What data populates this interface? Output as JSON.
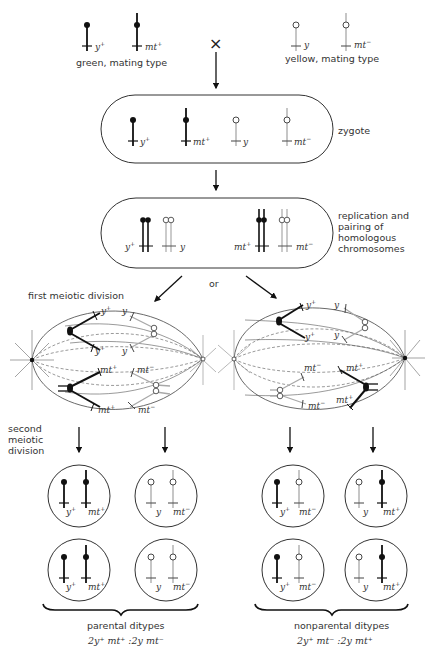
{
  "parents": {
    "left": {
      "label": "green, mating type",
      "genes": [
        {
          "name": "y",
          "sup": "+"
        },
        {
          "name": "mt",
          "sup": "+"
        }
      ],
      "allele_color": "dark"
    },
    "cross_symbol": "×",
    "right": {
      "label": "yellow, mating type",
      "genes": [
        {
          "name": "y",
          "sup": ""
        },
        {
          "name": "mt",
          "sup": "−"
        }
      ],
      "allele_color": "light"
    }
  },
  "stages": {
    "zygote": {
      "label": "zygote",
      "genes": [
        {
          "name": "y",
          "sup": "+"
        },
        {
          "name": "mt",
          "sup": "+"
        },
        {
          "name": "y",
          "sup": ""
        },
        {
          "name": "mt",
          "sup": "−"
        }
      ]
    },
    "replication": {
      "label_lines": [
        "replication and",
        "pairing of",
        "homologous",
        "chromosomes"
      ],
      "genes": [
        {
          "name": "y",
          "sup": "+"
        },
        {
          "name": "y",
          "sup": ""
        },
        {
          "name": "mt",
          "sup": "+"
        },
        {
          "name": "mt",
          "sup": "−"
        }
      ]
    },
    "or_label": "or",
    "first_meiotic_division": {
      "label": "first meiotic division",
      "left_spindle_genes": [
        "y+",
        "y",
        "y+",
        "y",
        "mt+",
        "mt−",
        "mt+",
        "mt−"
      ],
      "right_spindle_genes": [
        "y+",
        "y",
        "y+",
        "y",
        "mt−",
        "mt+",
        "mt−",
        "mt+"
      ]
    },
    "second_meiotic_division": {
      "label_lines": [
        "second",
        "meiotic",
        "division"
      ]
    }
  },
  "outcomes": {
    "parental": {
      "label": "parental ditypes",
      "ratio": "2y⁺ mt⁺ :2y mt⁻",
      "cells": [
        [
          {
            "name": "y",
            "sup": "+"
          },
          {
            "name": "mt",
            "sup": "+"
          }
        ],
        [
          {
            "name": "y",
            "sup": ""
          },
          {
            "name": "mt",
            "sup": "−"
          }
        ],
        [
          {
            "name": "y",
            "sup": "+"
          },
          {
            "name": "mt",
            "sup": "+"
          }
        ],
        [
          {
            "name": "y",
            "sup": ""
          },
          {
            "name": "mt",
            "sup": "−"
          }
        ]
      ]
    },
    "nonparental": {
      "label": "nonparental ditypes",
      "ratio": "2y⁺ mt⁻ :2y mt⁺",
      "cells": [
        [
          {
            "name": "y",
            "sup": "+"
          },
          {
            "name": "mt",
            "sup": "−"
          }
        ],
        [
          {
            "name": "y",
            "sup": ""
          },
          {
            "name": "mt",
            "sup": "+"
          }
        ],
        [
          {
            "name": "y",
            "sup": "+"
          },
          {
            "name": "mt",
            "sup": "−"
          }
        ],
        [
          {
            "name": "y",
            "sup": ""
          },
          {
            "name": "mt",
            "sup": "+"
          }
        ]
      ]
    }
  },
  "colors": {
    "dark_chromosome": "#111111",
    "light_chromosome": "#a8a8a8",
    "outline": "#333333"
  }
}
